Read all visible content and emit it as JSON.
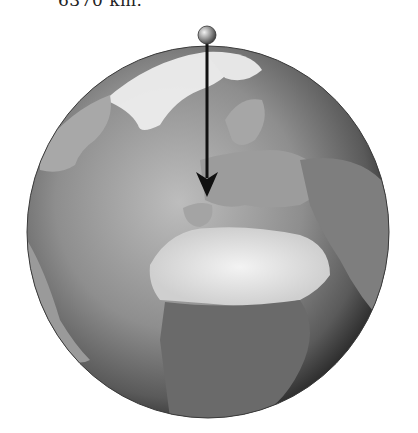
{
  "caption": {
    "text": "6370 km."
  },
  "figure": {
    "pin": {
      "color": "#888888"
    },
    "arrow": {
      "color": "#111111"
    }
  }
}
